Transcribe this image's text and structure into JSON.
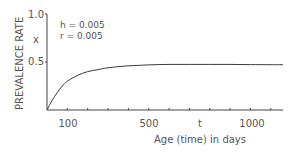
{
  "chart_data": {
    "type": "line",
    "title": "",
    "xlabel": "Age (time) in days",
    "x_axis_symbol": "t",
    "ylabel": "PREVALENCE RATE",
    "y_axis_symbol": "x",
    "xlim": [
      0,
      1160
    ],
    "ylim": [
      0,
      1.0
    ],
    "xticks": [
      100,
      200,
      300,
      400,
      500,
      600,
      700,
      800,
      900,
      1000,
      1100
    ],
    "xtick_labels": [
      {
        "value": 100,
        "label": "100"
      },
      {
        "value": 500,
        "label": "500"
      },
      {
        "value": 1000,
        "label": "1000"
      }
    ],
    "yticks": [
      {
        "value": 0.5,
        "label": "0.5"
      },
      {
        "value": 1.0,
        "label": "1.0"
      }
    ],
    "annotations": [
      "h = 0.005",
      "r = 0.005"
    ],
    "grid": false,
    "legend": "none",
    "series": [
      {
        "name": "prevalence",
        "x": [
          0,
          25,
          50,
          75,
          100,
          150,
          200,
          250,
          300,
          400,
          500,
          600,
          700,
          800,
          900,
          1000,
          1100,
          1160
        ],
        "values": [
          0.0,
          0.1,
          0.18,
          0.25,
          0.3,
          0.36,
          0.4,
          0.42,
          0.44,
          0.46,
          0.47,
          0.475,
          0.475,
          0.475,
          0.475,
          0.473,
          0.472,
          0.472
        ]
      }
    ]
  }
}
